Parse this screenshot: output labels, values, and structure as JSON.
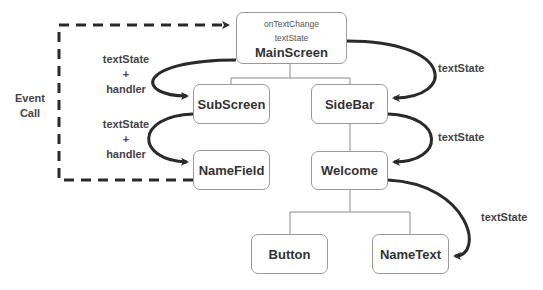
{
  "diagram": {
    "nodes": {
      "main_screen": {
        "title": "MainScreen",
        "props": [
          "onTextChange",
          "textState"
        ]
      },
      "sub_screen": {
        "title": "SubScreen"
      },
      "side_bar": {
        "title": "SideBar"
      },
      "name_field": {
        "title": "NameField"
      },
      "welcome": {
        "title": "Welcome"
      },
      "button": {
        "title": "Button"
      },
      "name_text": {
        "title": "NameText"
      }
    },
    "edge_labels": {
      "main_to_sub_line1": "textState",
      "main_to_sub_line2": "+",
      "main_to_sub_line3": "handler",
      "sub_to_field_line1": "textState",
      "sub_to_field_line2": "+",
      "sub_to_field_line3": "handler",
      "event_call_line1": "Event",
      "event_call_line2": "Call",
      "main_to_sidebar": "textState",
      "sidebar_to_welcome": "textState",
      "welcome_to_nametext": "textState"
    },
    "colors": {
      "arrow": "#2a2a2a",
      "tree_line": "#8a8a8a",
      "box_border": "#9a9a9a"
    }
  }
}
